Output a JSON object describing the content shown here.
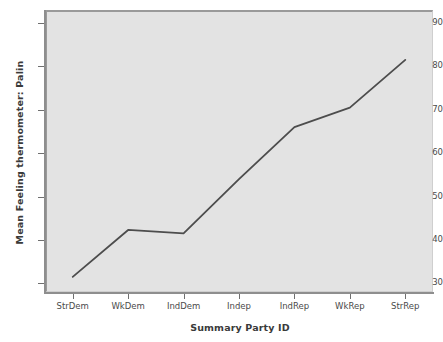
{
  "chart_data": {
    "type": "line",
    "title": "",
    "xlabel": "Summary Party ID",
    "ylabel": "Mean Feeling thermometer: Palin",
    "categories": [
      "StrDem",
      "WkDem",
      "IndDem",
      "Indep",
      "IndRep",
      "WkRep",
      "StrRep"
    ],
    "values": [
      31.5,
      42.3,
      41.5,
      54.0,
      66.0,
      70.5,
      81.5
    ],
    "series": [
      {
        "name": "Mean Feeling thermometer: Palin",
        "values": [
          31.5,
          42.3,
          41.5,
          54.0,
          66.0,
          70.5,
          81.5
        ]
      }
    ],
    "ylim": [
      28,
      93
    ],
    "y_ticks": [
      30,
      40,
      50,
      60,
      70,
      80,
      90
    ],
    "y_tick_labels": [
      "30",
      "40",
      "50",
      "60",
      "70",
      "80",
      "90"
    ],
    "grid": false,
    "legend": "none",
    "line_color": "#4d4d4d",
    "plot_background": "#e3e3e3",
    "axis_color": "#8e8e8e",
    "text_color": "#3a3a3a"
  }
}
